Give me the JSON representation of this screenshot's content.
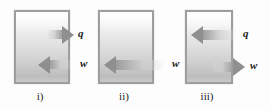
{
  "figure": {
    "background_color": "#fdfdfd",
    "box_border_color": "#9e9e9e",
    "arrow_color": "#8f8f8f",
    "label_color": "#1b1b1b"
  },
  "panels": [
    {
      "id": "i",
      "caption": "i)",
      "box": {
        "x": 14,
        "y": 10,
        "w": 56,
        "h": 74
      },
      "arrows": [
        {
          "symbol": "q",
          "name": "heat-arrow",
          "direction": "right",
          "meaning": "heat leaving the system",
          "x": 46,
          "y": 30,
          "length": 28,
          "thickness": 9,
          "label_x": 78,
          "label_y": 25
        },
        {
          "symbol": "w",
          "name": "work-arrow",
          "direction": "left",
          "meaning": "work done on the system",
          "x": 38,
          "y": 60,
          "length": 32,
          "thickness": 9,
          "label_x": 80,
          "label_y": 55
        }
      ]
    },
    {
      "id": "ii",
      "caption": "ii)",
      "box": {
        "x": 98,
        "y": 10,
        "w": 56,
        "h": 74
      },
      "arrows": [
        {
          "symbol": "w",
          "name": "work-arrow",
          "direction": "left",
          "meaning": "work done on the system",
          "x": 104,
          "y": 60,
          "length": 60,
          "thickness": 10,
          "label_x": 172,
          "label_y": 55
        }
      ]
    },
    {
      "id": "iii",
      "caption": "iii)",
      "box": {
        "x": 185,
        "y": 10,
        "w": 48,
        "h": 74
      },
      "arrows": [
        {
          "symbol": "q",
          "name": "heat-arrow",
          "direction": "left",
          "meaning": "heat entering the system",
          "x": 191,
          "y": 30,
          "length": 44,
          "thickness": 10,
          "label_x": 243,
          "label_y": 25
        },
        {
          "symbol": "w",
          "name": "work-arrow",
          "direction": "right",
          "meaning": "work done by the system",
          "x": 213,
          "y": 62,
          "length": 32,
          "thickness": 10,
          "label_x": 250,
          "label_y": 57
        }
      ]
    }
  ]
}
